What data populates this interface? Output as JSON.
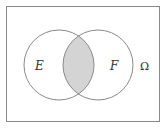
{
  "diagram": {
    "type": "venn",
    "universe": {
      "label": "Ω",
      "x": 6,
      "y": 6,
      "width": 154,
      "height": 116,
      "stroke": "#8a8a8a"
    },
    "sets": [
      {
        "name": "E",
        "label": "E",
        "cx": 59,
        "cy": 65,
        "r": 35
      },
      {
        "name": "F",
        "label": "F",
        "cx": 98,
        "cy": 65,
        "r": 35
      }
    ],
    "shaded_region": "E ∩ F",
    "colors": {
      "circle_stroke": "#8a8a8a",
      "shade_fill": "#d4d4d4",
      "background": "#ffffff"
    },
    "labels": {
      "e": "E",
      "f": "F",
      "omega": "Ω"
    }
  }
}
